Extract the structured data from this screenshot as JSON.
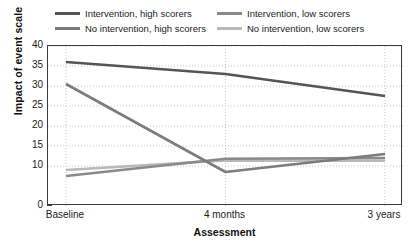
{
  "chart_data": {
    "type": "line",
    "title": "",
    "xlabel": "Assessment",
    "ylabel": "Impact of event scale",
    "categories": [
      "Baseline",
      "4 months",
      "3 years"
    ],
    "ylim": [
      0,
      40
    ],
    "yticks": [
      0,
      10,
      15,
      20,
      25,
      30,
      35,
      40
    ],
    "ytick_labels": [
      "0",
      "10",
      "15",
      "20",
      "25",
      "30",
      "35",
      "40"
    ],
    "grid": true,
    "grid_style": "dotted",
    "legend_position": "top",
    "series": [
      {
        "name": "Intervention, high scorers",
        "color": "#555555",
        "values": [
          36,
          33,
          27.5
        ]
      },
      {
        "name": "Intervention, low scorers",
        "color": "#8a8a8a",
        "values": [
          7.5,
          11.8,
          12
        ]
      },
      {
        "name": "No intervention, high scorers",
        "color": "#7c7c7c",
        "values": [
          30.5,
          8.5,
          13
        ]
      },
      {
        "name": "No intervention, low scorers",
        "color": "#b9b9b9",
        "values": [
          9,
          11.4,
          11.3
        ]
      }
    ]
  },
  "legend": {
    "items": [
      {
        "label": "Intervention, high scorers",
        "color": "#555555"
      },
      {
        "label": "Intervention, low scorers",
        "color": "#8a8a8a"
      },
      {
        "label": "No intervention, high scorers",
        "color": "#7c7c7c"
      },
      {
        "label": "No intervention, low scorers",
        "color": "#b9b9b9"
      }
    ]
  },
  "axes": {
    "y_title": "Impact of event scale",
    "x_title": "Assessment",
    "y_labels": [
      "40",
      "35",
      "30",
      "25",
      "20",
      "15",
      "10",
      "0"
    ],
    "x_labels": [
      "Baseline",
      "4 months",
      "3 years"
    ]
  },
  "colors": {
    "axis": "#3a3a3a",
    "grid": "#b5b5b5",
    "text": "#1c1c1c",
    "background": "#ffffff"
  }
}
